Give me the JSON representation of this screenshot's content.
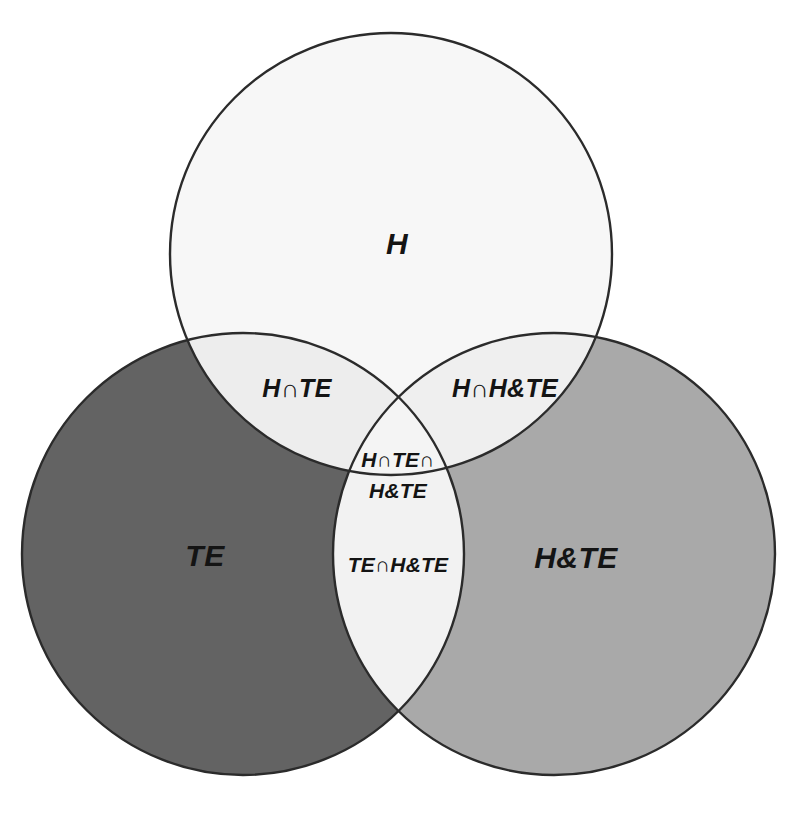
{
  "diagram": {
    "type": "venn-3-set",
    "title_visible": false,
    "background_color": "#ffffff",
    "outline_color": "#2b2b2b",
    "sets": [
      {
        "id": "H",
        "label": "H",
        "position": "top",
        "fill_color": "#f7f7f7",
        "center": {
          "cx": 391,
          "cy": 254,
          "r": 221
        }
      },
      {
        "id": "TE",
        "label": "TE",
        "position": "bottom-left",
        "fill_color": "#636363",
        "center": {
          "cx": 243,
          "cy": 554,
          "r": 221
        }
      },
      {
        "id": "HTE",
        "label": "H&TE",
        "position": "bottom-right",
        "fill_color": "#a9a9a9",
        "center": {
          "cx": 554,
          "cy": 554,
          "r": 221
        }
      }
    ],
    "intersections": [
      {
        "id": "H-TE",
        "label": "H∩TE",
        "fill_color": "#ededed",
        "label_x": 297,
        "label_y": 390
      },
      {
        "id": "H-HTE",
        "label": "H∩H&TE",
        "fill_color": "#efefef",
        "label_x": 505,
        "label_y": 390
      },
      {
        "id": "TE-HTE",
        "label": "TE∩H&TE",
        "fill_color": "#f2f2f2",
        "label_x": 398,
        "label_y": 566
      },
      {
        "id": "H-TE-HTE",
        "label_line1": "H∩TE∩",
        "label_line2": "H&TE",
        "fill_color": "#f4f4f4",
        "label_x": 398,
        "label_y1": 461,
        "label_y2": 492
      }
    ],
    "set_label_positions": {
      "H": {
        "x": 397,
        "y": 246
      },
      "TE": {
        "x": 205,
        "y": 558
      },
      "HTE": {
        "x": 576,
        "y": 560
      }
    }
  }
}
